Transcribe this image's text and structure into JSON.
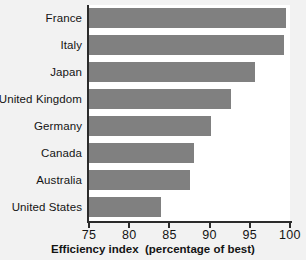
{
  "chart_data": {
    "type": "bar",
    "orientation": "horizontal",
    "title": "",
    "xlabel": "Efficiency index  (percentage of best)",
    "ylabel": "",
    "xlim": [
      75,
      100
    ],
    "xticks": [
      75,
      80,
      85,
      90,
      95,
      100
    ],
    "grid": false,
    "legend": null,
    "bar_color": "#808080",
    "axis_color": "#2b2b2b",
    "background": "#f2f2f2",
    "plot_background": "#ffffff",
    "categories": [
      "France",
      "Italy",
      "Japan",
      "United Kingdom",
      "Germany",
      "Canada",
      "Australia",
      "United States"
    ],
    "values": [
      99.5,
      99.2,
      95.6,
      92.6,
      90.2,
      88.1,
      87.6,
      83.9
    ]
  }
}
